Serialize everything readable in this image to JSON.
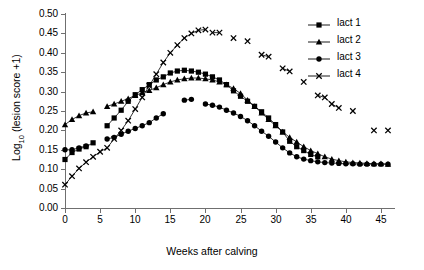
{
  "chart_data": {
    "type": "scatter",
    "title": "",
    "xlabel": "Weeks after calving",
    "ylabel": "Log10 (lesion score +1)",
    "ylabel_base": "Log",
    "ylabel_sub": "10",
    "ylabel_rest": " (lesion score +1)",
    "xlim": [
      0,
      47
    ],
    "ylim": [
      0.0,
      0.5
    ],
    "xticks": [
      0,
      5,
      10,
      15,
      20,
      25,
      30,
      35,
      40,
      45
    ],
    "yticks": [
      "0.00",
      "0.05",
      "0.10",
      "0.15",
      "0.20",
      "0.25",
      "0.30",
      "0.35",
      "0.40",
      "0.45",
      "0.50"
    ],
    "ytick_values": [
      0.0,
      0.05,
      0.1,
      0.15,
      0.2,
      0.25,
      0.3,
      0.35,
      0.4,
      0.45,
      0.5
    ],
    "grid": false,
    "legend_position": "top-right",
    "marker_color": "#000000",
    "line_color": "#000000",
    "axis_color": "#6f6f6f",
    "series": [
      {
        "name": "lact 1",
        "marker": "square",
        "x": [
          0,
          1,
          2,
          3,
          4,
          6,
          7,
          8,
          9,
          10,
          11,
          12,
          13,
          14,
          15,
          16,
          17,
          18,
          19,
          20,
          21,
          22,
          23,
          24,
          25,
          26,
          27,
          28,
          29,
          30,
          31,
          32,
          33,
          34,
          35,
          36
        ],
        "y": [
          0.125,
          0.143,
          0.152,
          0.158,
          0.168,
          0.212,
          0.232,
          0.252,
          0.275,
          0.292,
          0.305,
          0.318,
          0.33,
          0.338,
          0.348,
          0.353,
          0.355,
          0.353,
          0.35,
          0.345,
          0.338,
          0.33,
          0.318,
          0.302,
          0.288,
          0.275,
          0.262,
          0.248,
          0.232,
          0.215,
          0.196,
          0.172,
          0.158,
          0.148,
          0.138,
          0.132
        ]
      },
      {
        "name": "lact 2",
        "marker": "triangle",
        "x": [
          0,
          1,
          2,
          3,
          4,
          6,
          7,
          8,
          9,
          10,
          11,
          12,
          13,
          14,
          15,
          16,
          17,
          18,
          19,
          20,
          21,
          22,
          23,
          24,
          25,
          26,
          27,
          28,
          29,
          30,
          31,
          32,
          33,
          34,
          35,
          36,
          37,
          38,
          39,
          40,
          41,
          42,
          43,
          44,
          45,
          46
        ],
        "y": [
          0.215,
          0.228,
          0.238,
          0.245,
          0.248,
          0.262,
          0.268,
          0.275,
          0.282,
          0.29,
          0.297,
          0.303,
          0.31,
          0.318,
          0.325,
          0.33,
          0.333,
          0.335,
          0.335,
          0.333,
          0.33,
          0.325,
          0.318,
          0.308,
          0.295,
          0.278,
          0.262,
          0.245,
          0.228,
          0.212,
          0.196,
          0.182,
          0.17,
          0.158,
          0.148,
          0.14,
          0.132,
          0.126,
          0.122,
          0.119,
          0.117,
          0.116,
          0.115,
          0.114,
          0.114,
          0.113
        ]
      },
      {
        "name": "lact 3",
        "marker": "circle",
        "x": [
          0,
          1,
          2,
          3,
          6,
          7,
          8,
          9,
          10,
          11,
          12,
          13,
          14,
          17,
          18,
          20,
          21,
          22,
          23,
          24,
          25,
          26,
          27,
          28,
          29,
          30,
          31,
          32,
          33,
          34,
          35,
          36,
          37,
          38,
          39,
          40,
          41,
          42,
          43,
          44,
          45,
          46
        ],
        "y": [
          0.15,
          0.15,
          0.155,
          0.16,
          0.178,
          0.182,
          0.19,
          0.198,
          0.205,
          0.212,
          0.22,
          0.232,
          0.243,
          0.278,
          0.28,
          0.268,
          0.265,
          0.26,
          0.252,
          0.245,
          0.236,
          0.225,
          0.212,
          0.198,
          0.185,
          0.17,
          0.155,
          0.142,
          0.132,
          0.126,
          0.122,
          0.119,
          0.117,
          0.116,
          0.115,
          0.114,
          0.114,
          0.113,
          0.113,
          0.113,
          0.113,
          0.113
        ]
      },
      {
        "name": "lact 4",
        "marker": "x",
        "x": [
          0,
          1,
          2,
          3,
          4,
          5,
          6,
          7,
          8,
          9,
          10,
          11,
          12,
          13,
          14,
          15,
          16,
          17,
          18,
          19,
          20,
          21,
          22,
          24,
          26,
          28,
          29,
          31,
          32,
          34,
          36,
          37,
          38,
          39,
          41,
          44,
          46
        ],
        "y": [
          0.06,
          0.082,
          0.102,
          0.118,
          0.132,
          0.145,
          0.155,
          0.178,
          0.2,
          0.225,
          0.255,
          0.285,
          0.315,
          0.345,
          0.375,
          0.4,
          0.42,
          0.438,
          0.45,
          0.458,
          0.46,
          0.452,
          0.452,
          0.438,
          0.43,
          0.395,
          0.39,
          0.36,
          0.352,
          0.325,
          0.29,
          0.285,
          0.268,
          0.258,
          0.25,
          0.2,
          0.2
        ]
      }
    ],
    "connected_segments": {
      "lact 1": [
        [
          0,
          1,
          2,
          3,
          4
        ],
        [
          6,
          7,
          8,
          9,
          10,
          11,
          12,
          13,
          14,
          15,
          16,
          17,
          18,
          19,
          20,
          21,
          22,
          23,
          24,
          25,
          26,
          27,
          28,
          29,
          30,
          31,
          32,
          33,
          34,
          35,
          36
        ]
      ],
      "lact 2": [
        [
          0,
          1,
          2,
          3,
          4
        ],
        [
          6,
          7,
          8,
          9,
          10,
          11,
          12,
          13,
          14,
          15,
          16,
          17,
          18,
          19,
          20,
          21,
          22,
          23,
          24,
          25,
          26,
          27,
          28,
          29,
          30,
          31,
          32,
          33,
          34,
          35,
          36,
          37,
          38,
          39,
          40,
          41,
          42,
          43,
          44,
          45,
          46
        ]
      ],
      "lact 3": [
        [
          0,
          1,
          2,
          3
        ],
        [
          6,
          7,
          8,
          9,
          10,
          11,
          12,
          13,
          14
        ],
        [
          17,
          18
        ],
        [
          20,
          21,
          22,
          23,
          24,
          25,
          26,
          27,
          28,
          29,
          30,
          31,
          32,
          33,
          34,
          35,
          36,
          37,
          38,
          39,
          40,
          41,
          42,
          43,
          44,
          45,
          46
        ]
      ],
      "lact 4": [
        [
          0,
          1,
          2,
          3,
          4,
          5,
          6,
          7,
          8,
          9,
          10,
          11,
          12,
          13,
          14,
          15,
          16,
          17,
          18,
          19,
          20
        ],
        [
          21,
          22
        ],
        [
          24
        ],
        [
          26
        ],
        [
          28,
          29
        ],
        [
          31,
          32
        ],
        [
          34
        ],
        [
          36,
          37,
          38,
          39
        ],
        [
          41
        ],
        [
          44
        ],
        [
          46
        ]
      ]
    }
  },
  "legend": {
    "items": [
      {
        "label": "lact 1",
        "marker": "square"
      },
      {
        "label": "lact 2",
        "marker": "triangle"
      },
      {
        "label": "lact 3",
        "marker": "circle"
      },
      {
        "label": "lact 4",
        "marker": "x"
      }
    ]
  }
}
